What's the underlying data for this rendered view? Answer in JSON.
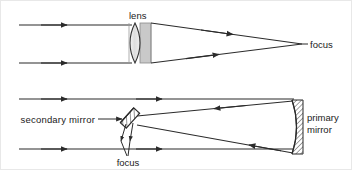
{
  "figure": {
    "width": 352,
    "height": 170,
    "background": "#ffffff",
    "line_color": "#2b2b2b",
    "lens_fill": "#d4d4d4",
    "lens_glass_fill": "#e9e9e9",
    "hatch_color": "#2b2b2b"
  },
  "top_diagram": {
    "name": "refractor",
    "labels": {
      "lens": "lens",
      "focus": "focus"
    },
    "incoming_rays": [
      {
        "y": 24,
        "x_start": 18,
        "x_end": 128,
        "arrow_x": 65
      },
      {
        "y": 62,
        "x_start": 18,
        "x_end": 128,
        "arrow_x": 65
      }
    ],
    "converging_rays": [
      {
        "x1": 150,
        "y1": 22,
        "x2": 300,
        "y2": 43,
        "arrow_t": 0.5
      },
      {
        "x1": 150,
        "y1": 62,
        "x2": 300,
        "y2": 43,
        "arrow_t": 0.5
      }
    ],
    "lens_element": {
      "x_left": 128,
      "x_right": 148,
      "y_top": 22,
      "y_bottom": 62,
      "mount_x_right": 150
    },
    "focus_point": {
      "x": 300,
      "y": 43
    }
  },
  "bottom_diagram": {
    "name": "reflector",
    "labels": {
      "secondary_mirror": "secondary mirror",
      "primary_mirror_line1": "primary",
      "primary_mirror_line2": "mirror",
      "focus": "focus"
    },
    "incoming_rays": [
      {
        "y": 98,
        "x_start": 18,
        "x_end": 293,
        "arrow_x": 160
      },
      {
        "y": 148,
        "x_start": 18,
        "x_end": 293,
        "arrow_x": 160
      }
    ],
    "incoming_arrows_left": [
      {
        "y": 98,
        "arrow_x": 65
      },
      {
        "y": 148,
        "arrow_x": 65
      }
    ],
    "reflected_rays": [
      {
        "x1": 293,
        "y1": 101,
        "x2": 136,
        "y2": 116,
        "arrow_t": 0.45
      },
      {
        "x1": 293,
        "y1": 150,
        "x2": 136,
        "y2": 124,
        "arrow_t": 0.45
      }
    ],
    "secondary_mirror": {
      "cx": 129,
      "cy": 117,
      "width": 8,
      "length": 20,
      "angle": -45
    },
    "primary_mirror": {
      "x_face": 291,
      "x_back": 302,
      "y_top": 100,
      "y_bottom": 152,
      "sagitta": 8
    },
    "focus_arrows": [
      {
        "x1": 126,
        "y1": 124,
        "x2": 120,
        "y2": 143
      },
      {
        "x1": 131,
        "y1": 124,
        "x2": 128,
        "y2": 143
      }
    ],
    "focus_leader": {
      "x1": 120,
      "y1": 143,
      "x2": 127,
      "y2": 155
    },
    "secondary_leader": {
      "x1": 97,
      "y1": 118,
      "x2": 122,
      "y2": 118
    }
  }
}
